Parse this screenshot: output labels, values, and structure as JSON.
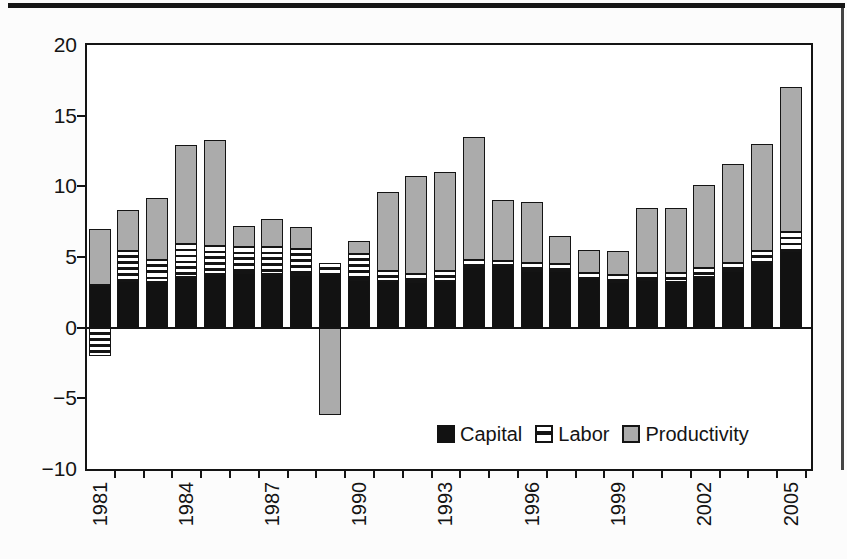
{
  "figure": {
    "legend": [
      {
        "label": "Capital",
        "swatch": "capital"
      },
      {
        "label": "Labor",
        "swatch": "labor"
      },
      {
        "label": "Productivity",
        "swatch": "productivity"
      }
    ]
  },
  "colors": {
    "capital": "#121212",
    "labor_stripe": "#141414",
    "labor_background": "#ffffff",
    "productivity": "#ababab",
    "axis": "#141414",
    "background": "#ffffff"
  },
  "chart_data": {
    "type": "bar",
    "stacked": true,
    "title": "",
    "xlabel": "",
    "ylabel": "",
    "grid": false,
    "legend_position": "inside-bottom-right",
    "ylim": [
      -10,
      20
    ],
    "yticks": [
      {
        "value": 20,
        "label": "20"
      },
      {
        "value": 15,
        "label": "15"
      },
      {
        "value": 10,
        "label": "10"
      },
      {
        "value": 5,
        "label": "5"
      },
      {
        "value": 0,
        "label": "0"
      },
      {
        "value": -5,
        "label": "−5"
      },
      {
        "value": -10,
        "label": "−10"
      }
    ],
    "categories": [
      1981,
      1982,
      1983,
      1984,
      1985,
      1986,
      1987,
      1988,
      1989,
      1990,
      1991,
      1992,
      1993,
      1994,
      1995,
      1996,
      1997,
      1998,
      1999,
      2000,
      2001,
      2002,
      2003,
      2004,
      2005
    ],
    "xtick_labels": [
      "1981",
      "1984",
      "1987",
      "1990",
      "1993",
      "1996",
      "1999",
      "2002",
      "2005"
    ],
    "xtick_label_step": 3,
    "series": [
      {
        "name": "Capital",
        "pattern": "solid",
        "color": "#121212",
        "values": [
          3.0,
          3.3,
          3.2,
          3.6,
          3.8,
          3.9,
          3.8,
          3.7,
          3.8,
          3.4,
          3.3,
          3.2,
          3.3,
          4.3,
          4.4,
          4.0,
          4.0,
          3.5,
          3.2,
          3.4,
          3.2,
          3.6,
          4.0,
          4.6,
          5.4
        ]
      },
      {
        "name": "Labor",
        "pattern": "horizontal-stripes",
        "color": "#ffffff",
        "values": [
          -2.0,
          2.1,
          1.6,
          2.3,
          2.0,
          1.8,
          1.9,
          1.9,
          0.8,
          1.8,
          0.7,
          0.6,
          0.7,
          0.5,
          0.3,
          0.6,
          0.5,
          0.4,
          0.5,
          0.5,
          0.7,
          0.6,
          0.6,
          0.8,
          1.4
        ]
      },
      {
        "name": "Productivity",
        "pattern": "solid",
        "color": "#ababab",
        "values": [
          4.0,
          2.9,
          4.4,
          7.0,
          7.5,
          1.5,
          2.0,
          1.5,
          -6.2,
          0.9,
          5.6,
          6.9,
          7.0,
          8.7,
          4.3,
          4.3,
          2.0,
          1.6,
          1.7,
          4.6,
          4.6,
          5.9,
          7.0,
          7.6,
          10.2
        ]
      }
    ]
  }
}
